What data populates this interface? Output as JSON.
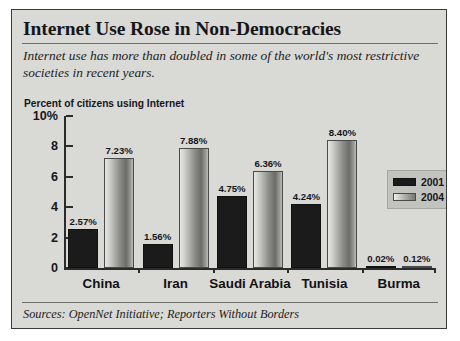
{
  "title": "Internet Use Rose in Non-Democracies",
  "subtitle": "Internet use has more than doubled in some of the world's most restrictive societies in recent years.",
  "axis_title": "Percent of citizens using Internet",
  "source": "Sources: OpenNet Initiative; Reporters Without Borders",
  "legend": {
    "items": [
      {
        "label": "2001",
        "color": "#1b1b1b"
      },
      {
        "label": "2004",
        "color": "#8d8d8a"
      }
    ]
  },
  "chart_data": {
    "type": "bar",
    "title": "Internet Use Rose in Non-Democracies",
    "subtitle": "Internet use has more than doubled in some of the world's most restrictive societies in recent years.",
    "xlabel": "",
    "ylabel": "Percent of citizens using Internet",
    "ylim": [
      0,
      10
    ],
    "yticks": [
      0,
      2,
      4,
      6,
      8,
      10
    ],
    "ytick_labels": [
      "0",
      "2",
      "4",
      "6",
      "8",
      "10%"
    ],
    "grid": false,
    "legend_position": "right",
    "categories": [
      "China",
      "Iran",
      "Saudi Arabia",
      "Tunisia",
      "Burma"
    ],
    "series": [
      {
        "name": "2001",
        "color": "#1b1b1b",
        "values": [
          2.57,
          1.56,
          4.75,
          4.24,
          0.02
        ],
        "labels": [
          "2.57%",
          "1.56%",
          "4.75%",
          "4.24%",
          "0.02%"
        ]
      },
      {
        "name": "2004",
        "color": "#8d8d8a",
        "values": [
          7.23,
          7.88,
          6.36,
          8.4,
          0.12
        ],
        "labels": [
          "7.23%",
          "7.88%",
          "6.36%",
          "8.40%",
          "0.12%"
        ]
      }
    ]
  }
}
